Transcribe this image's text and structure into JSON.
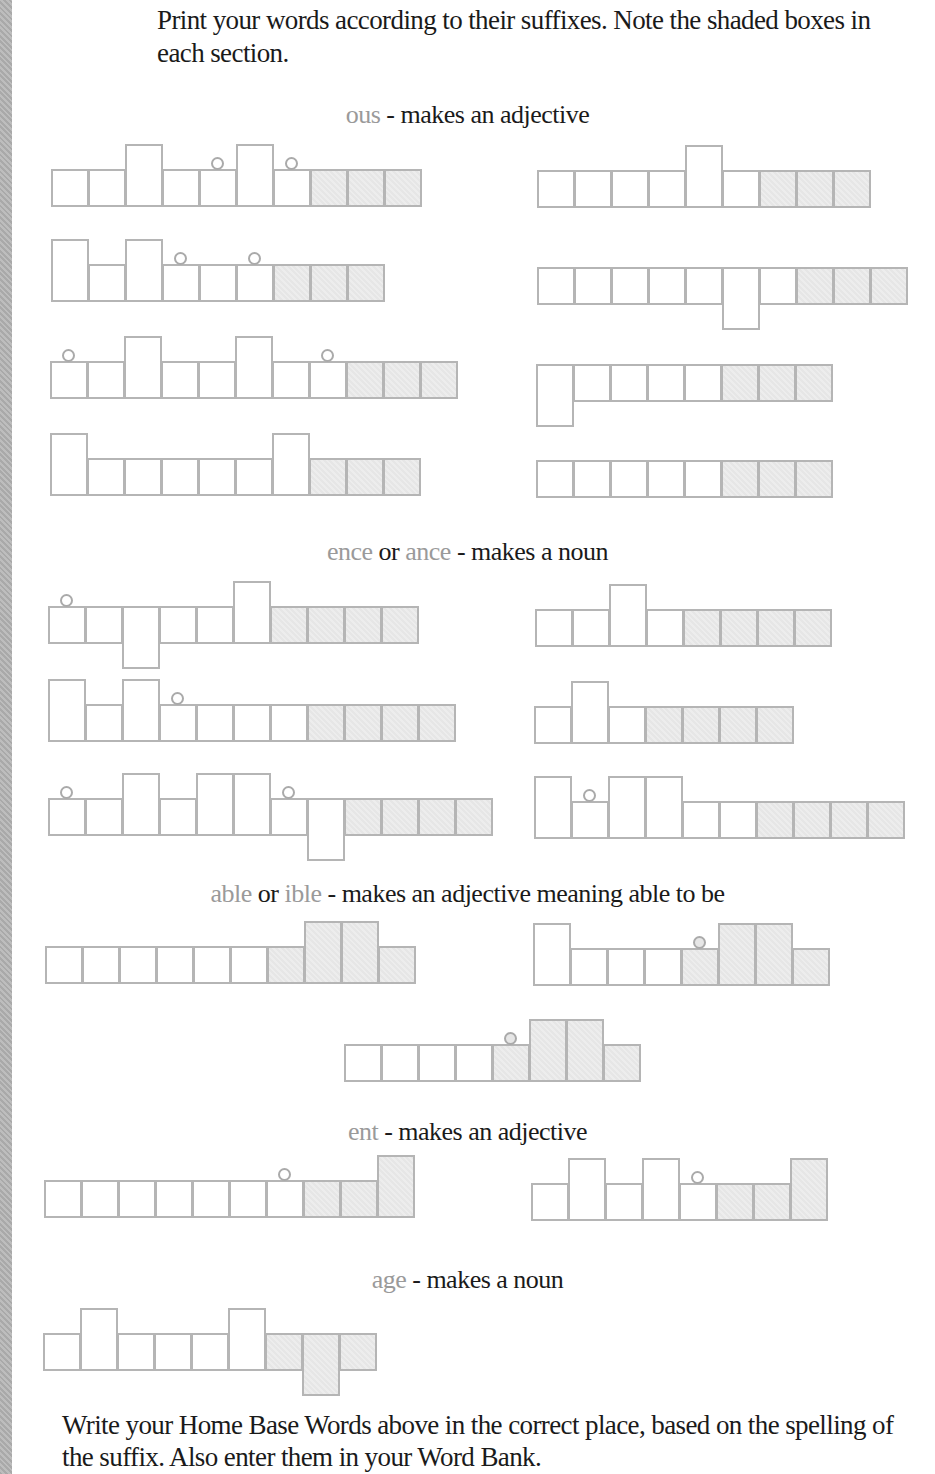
{
  "instructions": "Print your words according to their suffixes.  Note the shaded boxes in each section.",
  "footer": "Write your Home Base Words above in the correct place, based on the spelling of the suffix.  Also enter them in your Word Bank.",
  "colors": {
    "suffix_text": "#9a9a9a",
    "box_border": "#b5b5b5",
    "shaded_fill": "#e9e9e9",
    "text": "#1a1a1a"
  },
  "legend": {
    "x": "short letter box",
    "t": "tall letter box (ascender)",
    "d": "descender letter box",
    "s": "shaded suffix box",
    "o": "dot above (i/j)"
  },
  "sections": [
    {
      "id": "ous",
      "heading": {
        "suffix": "ous",
        "connector": "",
        "suffix2": "",
        "rest": " - makes an adjective"
      },
      "top": 100,
      "shapes": [
        {
          "x": 51,
          "bottom": 207,
          "boxes": [
            "x",
            "x",
            "t",
            "x",
            "xo",
            "t",
            "xo",
            "xs",
            "xs",
            "xs"
          ]
        },
        {
          "x": 537,
          "bottom": 208,
          "boxes": [
            "x",
            "x",
            "x",
            "x",
            "t",
            "x",
            "xs",
            "xs",
            "xs"
          ]
        },
        {
          "x": 51,
          "bottom": 302,
          "boxes": [
            "t",
            "x",
            "t",
            "xo",
            "x",
            "xo",
            "xs",
            "xs",
            "xs"
          ]
        },
        {
          "x": 537,
          "bottom": 305,
          "boxes": [
            "x",
            "x",
            "x",
            "x",
            "x",
            "d",
            "x",
            "xs",
            "xs",
            "xs"
          ]
        },
        {
          "x": 50,
          "bottom": 399,
          "boxes": [
            "xo",
            "x",
            "t",
            "x",
            "x",
            "t",
            "x",
            "xo",
            "xs",
            "xs",
            "xs"
          ]
        },
        {
          "x": 536,
          "bottom": 402,
          "boxes": [
            "d",
            "x",
            "x",
            "x",
            "x",
            "xs",
            "xs",
            "xs"
          ]
        },
        {
          "x": 50,
          "bottom": 496,
          "boxes": [
            "t",
            "x",
            "x",
            "x",
            "x",
            "x",
            "t",
            "xs",
            "xs",
            "xs"
          ]
        },
        {
          "x": 536,
          "bottom": 498,
          "boxes": [
            "x",
            "x",
            "x",
            "x",
            "x",
            "xs",
            "xs",
            "xs"
          ]
        }
      ]
    },
    {
      "id": "ence-ance",
      "heading": {
        "suffix": "ence",
        "connector": " or ",
        "suffix2": "ance",
        "rest": " - makes a noun"
      },
      "top": 537,
      "shapes": [
        {
          "x": 48,
          "bottom": 644,
          "boxes": [
            "xo",
            "x",
            "d",
            "x",
            "x",
            "t",
            "xs",
            "xs",
            "xs",
            "xs"
          ]
        },
        {
          "x": 535,
          "bottom": 647,
          "boxes": [
            "x",
            "x",
            "t",
            "x",
            "xs",
            "xs",
            "xs",
            "xs"
          ]
        },
        {
          "x": 48,
          "bottom": 742,
          "boxes": [
            "t",
            "x",
            "t",
            "xo",
            "x",
            "x",
            "x",
            "xs",
            "xs",
            "xs",
            "xs"
          ]
        },
        {
          "x": 534,
          "bottom": 744,
          "boxes": [
            "x",
            "t",
            "x",
            "xs",
            "xs",
            "xs",
            "xs"
          ]
        },
        {
          "x": 48,
          "bottom": 836,
          "boxes": [
            "xo",
            "x",
            "t",
            "x",
            "t",
            "t",
            "xo",
            "d",
            "xs",
            "xs",
            "xs",
            "xs"
          ]
        },
        {
          "x": 534,
          "bottom": 839,
          "boxes": [
            "t",
            "xo",
            "t",
            "t",
            "x",
            "x",
            "xs",
            "xs",
            "xs",
            "xs"
          ]
        }
      ]
    },
    {
      "id": "able-ible",
      "heading": {
        "suffix": "able",
        "connector": " or ",
        "suffix2": "ible",
        "rest": " - makes an adjective meaning able to be"
      },
      "top": 879,
      "shapes": [
        {
          "x": 45,
          "bottom": 984,
          "boxes": [
            "x",
            "x",
            "x",
            "x",
            "x",
            "x",
            "xs",
            "ts",
            "ts",
            "xs"
          ]
        },
        {
          "x": 533,
          "bottom": 986,
          "boxes": [
            "t",
            "x",
            "x",
            "x",
            "xso",
            "ts",
            "ts",
            "xs"
          ]
        },
        {
          "x": 344,
          "bottom": 1082,
          "boxes": [
            "x",
            "x",
            "x",
            "x",
            "xso",
            "ts",
            "ts",
            "xs"
          ]
        }
      ]
    },
    {
      "id": "ent",
      "heading": {
        "suffix": "ent",
        "connector": "",
        "suffix2": "",
        "rest": " - makes an adjective"
      },
      "top": 1117,
      "shapes": [
        {
          "x": 44,
          "bottom": 1218,
          "boxes": [
            "x",
            "x",
            "x",
            "x",
            "x",
            "x",
            "xo",
            "xs",
            "xs",
            "ts"
          ]
        },
        {
          "x": 531,
          "bottom": 1221,
          "boxes": [
            "x",
            "t",
            "x",
            "t",
            "xo",
            "xs",
            "xs",
            "ts"
          ]
        }
      ]
    },
    {
      "id": "age",
      "heading": {
        "suffix": "age",
        "connector": "",
        "suffix2": "",
        "rest": " - makes a noun"
      },
      "top": 1265,
      "shapes": [
        {
          "x": 43,
          "bottom": 1371,
          "boxes": [
            "x",
            "t",
            "x",
            "x",
            "x",
            "t",
            "xs",
            "ds",
            "xs"
          ]
        }
      ]
    }
  ]
}
